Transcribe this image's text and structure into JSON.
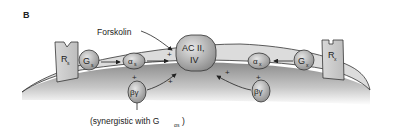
{
  "panel_label": "B",
  "forskolin": "Forskolin",
  "adenylyl_cyclase": {
    "line1": "AC II,",
    "line2": "IV"
  },
  "left": {
    "receptor": {
      "main": "R",
      "sub": "s"
    },
    "g_protein": {
      "main": "G",
      "sub": "s"
    },
    "alpha": {
      "main": "α",
      "sub": "s"
    },
    "beta_gamma": "βγ"
  },
  "right": {
    "receptor": {
      "main": "R",
      "sub": "x"
    },
    "g_protein": {
      "main": "G",
      "sub": "x"
    },
    "alpha": {
      "main": "α",
      "sub": "x"
    },
    "beta_gamma": "βγ"
  },
  "plus_sign": "+",
  "annotation": {
    "prefix": "(synergistic with G",
    "sub": "αs",
    "suffix": ")"
  }
}
